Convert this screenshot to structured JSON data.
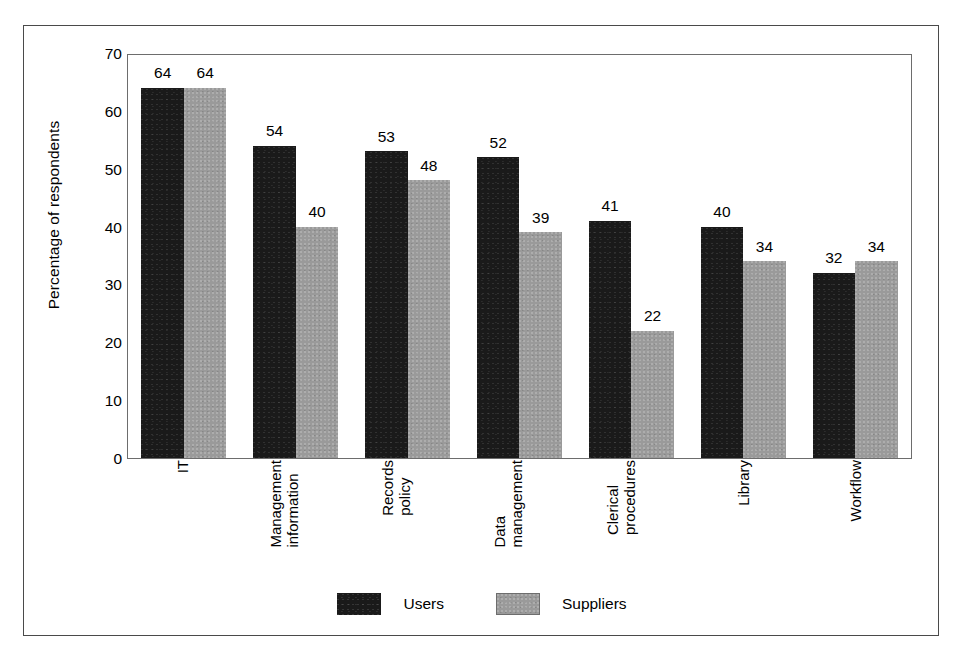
{
  "chart_data": {
    "type": "bar",
    "title": "",
    "xlabel": "",
    "ylabel": "Percentage of respondents",
    "ylim": [
      0,
      70
    ],
    "ytick_step": 10,
    "yticks": [
      70,
      60,
      50,
      40,
      30,
      20,
      10,
      0
    ],
    "grid": false,
    "legend_position": "bottom-center",
    "categories": [
      "IT",
      "Management information",
      "Records policy",
      "Data management",
      "Clerical procedures",
      "Library",
      "Workflow"
    ],
    "category_lines": [
      [
        "IT"
      ],
      [
        "Management",
        "information"
      ],
      [
        "Records",
        "policy"
      ],
      [
        "Data",
        "management"
      ],
      [
        "Clerical",
        "procedures"
      ],
      [
        "Library"
      ],
      [
        "Workflow"
      ]
    ],
    "series": [
      {
        "name": "Users",
        "color": "#1a1a1a",
        "values": [
          64,
          54,
          53,
          52,
          41,
          40,
          32
        ]
      },
      {
        "name": "Suppliers",
        "color": "#9a9a9a",
        "values": [
          64,
          40,
          48,
          39,
          22,
          34,
          34
        ]
      }
    ]
  },
  "legend": {
    "items": [
      {
        "label": "Users",
        "swatch": "users"
      },
      {
        "label": "Suppliers",
        "swatch": "suppliers"
      }
    ]
  },
  "axis": {
    "y_title": "Percentage of respondents"
  },
  "colors": {
    "users_bar": "#1a1a1a",
    "suppliers_bar": "#9a9a9a",
    "frame": "#4a4a4a",
    "plot_border": "#6d6d6d",
    "background": "#ffffff",
    "text": "#000000"
  }
}
